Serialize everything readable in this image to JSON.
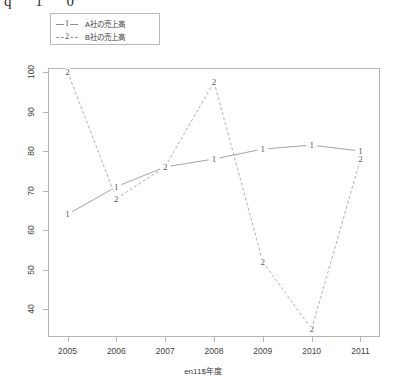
{
  "artifact": {
    "top_text": "q 1 0"
  },
  "legend": {
    "position": "top-left",
    "entries": [
      {
        "glyph": "1",
        "label": "A社の売上高",
        "style": "solid"
      },
      {
        "glyph": "2",
        "label": "B社の売上高",
        "style": "dashed"
      }
    ]
  },
  "axes": {
    "xlabel": "en11$年度",
    "ylabel": "",
    "xticks": [
      "2005",
      "2006",
      "2007",
      "2008",
      "2009",
      "2010",
      "2011"
    ],
    "yticks": [
      "40",
      "50",
      "60",
      "70",
      "80",
      "90",
      "100"
    ]
  },
  "chart_data": {
    "type": "line",
    "title": "",
    "subtitle": "",
    "xlabel": "en11$年度",
    "ylabel": "",
    "categories": [
      "2005",
      "2006",
      "2007",
      "2008",
      "2009",
      "2010",
      "2011"
    ],
    "x": [
      2005,
      2006,
      2007,
      2008,
      2009,
      2010,
      2011
    ],
    "xlim": [
      2004.6,
      2011.4
    ],
    "ylim": [
      33,
      101
    ],
    "grid": false,
    "legend_position": "top-left",
    "point_labels": "series-number",
    "series": [
      {
        "name": "A社の売上高",
        "glyph": "1",
        "style": "solid",
        "color": "#8d8d8d",
        "values": [
          64,
          71,
          76,
          78,
          80.5,
          81.5,
          80
        ]
      },
      {
        "name": "B社の売上高",
        "glyph": "2",
        "style": "dashed",
        "color": "#9a9a9a",
        "values": [
          100,
          68,
          76,
          97.5,
          52,
          35,
          78
        ]
      }
    ]
  },
  "colors": {
    "background": "#ffffff",
    "axis": "#b5b5b5",
    "text": "#3d3d3d",
    "series1": "#8d8d8d",
    "series2": "#9a9a9a"
  }
}
